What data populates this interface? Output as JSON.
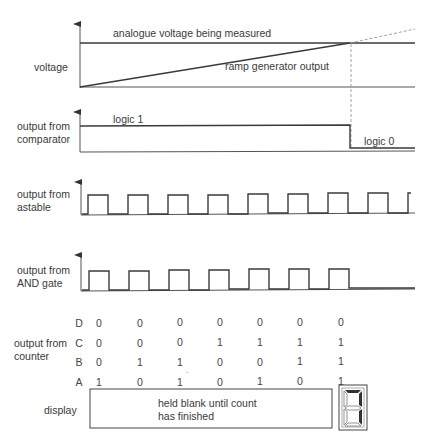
{
  "diagram": {
    "title": "",
    "panels": {
      "voltage": {
        "label": "voltage",
        "annotation_measured": "analogue voltage being measured",
        "annotation_ramp": "ramp generator output"
      },
      "comparator": {
        "label_line1": "output from",
        "label_line2": "comparator",
        "annotation_high": "logic 1",
        "annotation_low": "logic 0"
      },
      "astable": {
        "label_line1": "output from",
        "label_line2": "astable",
        "pulse_count": 8
      },
      "and_gate": {
        "label_line1": "output from",
        "label_line2": "AND gate",
        "pulse_count": 7
      },
      "counter": {
        "label_line1": "output from",
        "label_line2": "counter",
        "rows": [
          {
            "bit": "D",
            "values": [
              "0",
              "0",
              "0",
              "0",
              "0",
              "0",
              "0"
            ]
          },
          {
            "bit": "C",
            "values": [
              "0",
              "0",
              "0",
              "1",
              "1",
              "1",
              "1"
            ]
          },
          {
            "bit": "B",
            "values": [
              "0",
              "1",
              "1",
              "0",
              "0",
              "1",
              "1"
            ]
          },
          {
            "bit": "A",
            "values": [
              "1",
              "0",
              "1",
              "0",
              "1",
              "0",
              "1"
            ]
          }
        ]
      },
      "display": {
        "label": "display",
        "text_line1": "held blank until count",
        "text_line2": "has finished",
        "seven_segment_digit": "7"
      }
    }
  }
}
